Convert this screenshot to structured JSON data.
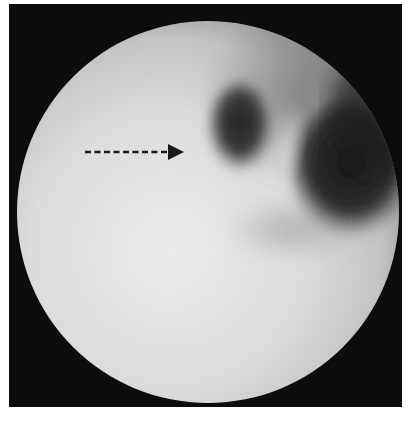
{
  "image": {
    "type": "endoscopic-view",
    "description": "Circular grayscale endoscopic field showing two dark lumens (orifices) separated by a pale ridge; dashed arrow points to the left lumen",
    "colors": {
      "frame": "#0c0c0c",
      "mucosa_light": "#e4e4e4",
      "mucosa_mid": "#b8b8b8",
      "lumen_dark": "#2a2a2a",
      "arrow": "#1a1a1a",
      "background": "#ffffff"
    }
  },
  "annotations": [
    {
      "kind": "dashed-arrow",
      "direction": "right",
      "target": "left-dark-lumen",
      "start": [
        85,
        152
      ],
      "end": [
        184,
        152
      ]
    }
  ]
}
